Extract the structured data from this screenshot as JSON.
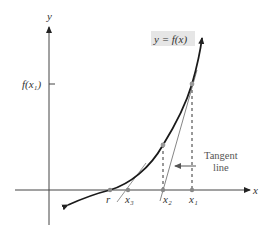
{
  "figure": {
    "type": "diagram",
    "axes": {
      "x_label": "x",
      "y_label": "y"
    },
    "curve_label": "y = f(x)",
    "y_tick_label": "f(x₁)",
    "x_points": [
      {
        "name": "r",
        "label": "r"
      },
      {
        "name": "x3",
        "label": "x₃"
      },
      {
        "name": "x2",
        "label": "x₂"
      },
      {
        "name": "x1",
        "label": "x₁"
      }
    ],
    "annotation": {
      "line1": "Tangent",
      "line2": "line"
    },
    "colors": {
      "curve": "#1a1a1a",
      "axis": "#444444",
      "tangent": "#777777",
      "point": "#888888",
      "label_bg": "#e6e6e6"
    }
  }
}
